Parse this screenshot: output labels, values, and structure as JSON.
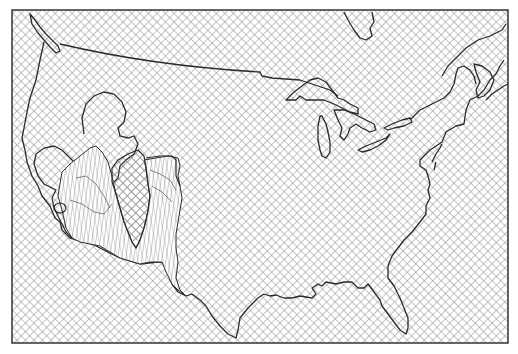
{
  "map": {
    "title": "",
    "region": "Contiguous United States",
    "frame": {
      "x": 12,
      "y": 10,
      "width": 496,
      "height": 333
    },
    "colors": {
      "background": "#ffffff",
      "hatch": "#8a8a8a",
      "coastline": "#2a2a2a",
      "highlight_fill": "#ffffff",
      "highlight_hatch": "#6a6a6a",
      "frame": "#333333"
    },
    "fill_pattern": "diagonal-crosshatch",
    "highlight_region": {
      "label": "",
      "location": "southwest",
      "pattern": "vertical-triangulated-lines"
    },
    "legend": []
  }
}
